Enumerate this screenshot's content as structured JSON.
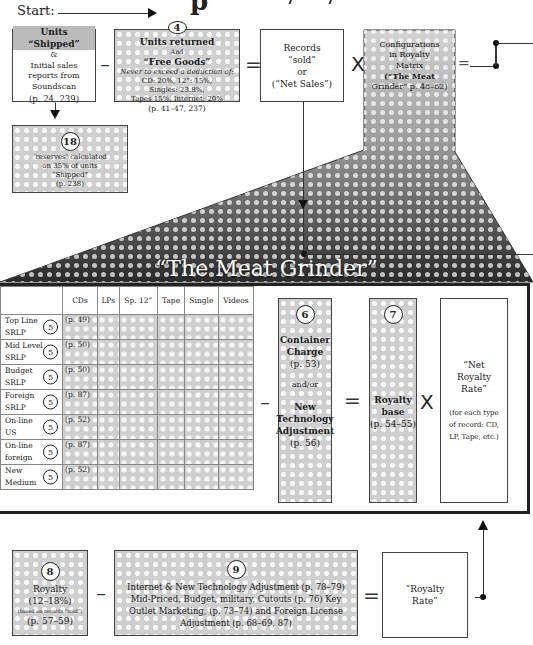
{
  "header": {
    "title_fragment": "p",
    "start_label": "Start:"
  },
  "row1": {
    "shipped": {
      "title": "Units “Shipped”",
      "amp": "&",
      "line1": "Initial sales",
      "line2": "reports from",
      "line3": "Soundscan",
      "ref": "(p. 24, 239)"
    },
    "returned": {
      "num": "4",
      "title": "Units returned",
      "and": "And",
      "title2": "“Free Goods”",
      "l1": "Never to exceed a deduction of:",
      "l2": "CD: 20%, 12”: 15%,",
      "l3": "Singles: 23.8%,",
      "l4": "Tapes 15%, Internet: 20%",
      "ref": "(p. 41–47, 237)"
    },
    "sold": {
      "l1": "Records",
      "l2": "“sold”",
      "l3": "or",
      "l4": "(“Net Sales”)"
    },
    "config": {
      "l1": "Configurations",
      "l2": "in Royalty",
      "l3": "Matrix",
      "l4": "(“The Meat",
      "l5": "Grinder” p. 48–62)"
    },
    "ops": {
      "minus": "–",
      "equals": "=",
      "times": "X",
      "equals2": "="
    }
  },
  "reserves": {
    "num": "18",
    "l1": "‘reserves’ calculated",
    "l2": "on 35% of units",
    "l3": "“Shipped”",
    "ref": "(p. 238)"
  },
  "grinder": {
    "title": "“The Meat Grinder”",
    "columns": [
      "",
      "CDs",
      "LPs",
      "Sp. 12”",
      "Tape",
      "Single",
      "Videos"
    ],
    "rows": [
      {
        "l1": "Top Line",
        "l2": "SRLP",
        "num": "5",
        "ref": "(p. 49)"
      },
      {
        "l1": "Mid Level",
        "l2": "SRLP",
        "num": "5",
        "ref": "(p. 50)"
      },
      {
        "l1": "Budget",
        "l2": "SRLP",
        "num": "5",
        "ref": "(p. 50)"
      },
      {
        "l1": "Foreign",
        "l2": "SRLP",
        "num": "5",
        "ref": "(p. 87)"
      },
      {
        "l1": "On-line",
        "l2": "US",
        "num": "5",
        "ref": "(p. 52)"
      },
      {
        "l1": "On-line",
        "l2": "foreign",
        "num": "5",
        "ref": "(p. 87)"
      },
      {
        "l1": "New",
        "l2": "Medium",
        "num": "5",
        "ref": "(p. 52)"
      }
    ],
    "container": {
      "num": "6",
      "l1": "Container",
      "l2": "Charge",
      "ref1": "(p. 53)",
      "andor": "and/or",
      "l3": "New",
      "l4": "Technology",
      "l5": "Adjustment",
      "ref2": "(p. 56)"
    },
    "base": {
      "num": "7",
      "l1": "Royalty",
      "l2": "base",
      "ref": "(p. 54–55)"
    },
    "netrate": {
      "l1": "“Net",
      "l2": "Royalty",
      "l3": "Rate”",
      "n1": "(for each type",
      "n2": "of record: CD,",
      "n3": "LP, Tape, etc.)"
    },
    "ops": {
      "minus": "–",
      "equals": "=",
      "times": "X"
    }
  },
  "row3": {
    "royalty": {
      "num": "8",
      "l1": "Royalty",
      "l2": "(12–18%)",
      "l3": "(based on records “sold”)",
      "ref": "(p. 57–59)"
    },
    "adjust": {
      "num": "9",
      "l1": "Internet & New Technology Adjustment (p. 78–79)",
      "l2": "Mid-Priced, Budget, military, Cutouts (p. 76) Key",
      "l3": "Outlet Marketing, (p. 73–74) and Foreign License",
      "l4": "Adjustment   (p. 68–69, 87)"
    },
    "rate": {
      "l1": "“Royalty",
      "l2": "Rate”"
    },
    "ops": {
      "minus": "–",
      "equals": "="
    }
  }
}
